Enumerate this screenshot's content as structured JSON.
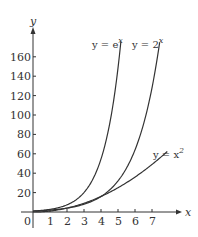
{
  "chart_data": {
    "type": "line",
    "title": "",
    "xlabel": "x",
    "ylabel": "y",
    "xlim": [
      0,
      7.8
    ],
    "ylim": [
      0,
      175
    ],
    "x_ticks": [
      0,
      1,
      2,
      3,
      4,
      5,
      6,
      7
    ],
    "y_ticks": [
      20,
      40,
      60,
      80,
      100,
      120,
      140,
      160
    ],
    "grid": false,
    "series": [
      {
        "name": "y = e^x",
        "label_base": "y = e",
        "label_exp": "x",
        "function": "exp",
        "x_range": [
          0,
          5.17
        ]
      },
      {
        "name": "y = 2^x",
        "label_base": "y = 2",
        "label_exp": "x",
        "function": "pow2",
        "x_range": [
          0,
          7.45
        ]
      },
      {
        "name": "y = x^2",
        "label_base": "y = x",
        "label_exp": "2",
        "function": "square",
        "x_range": [
          0,
          7.9
        ]
      }
    ],
    "color": "#333333"
  }
}
